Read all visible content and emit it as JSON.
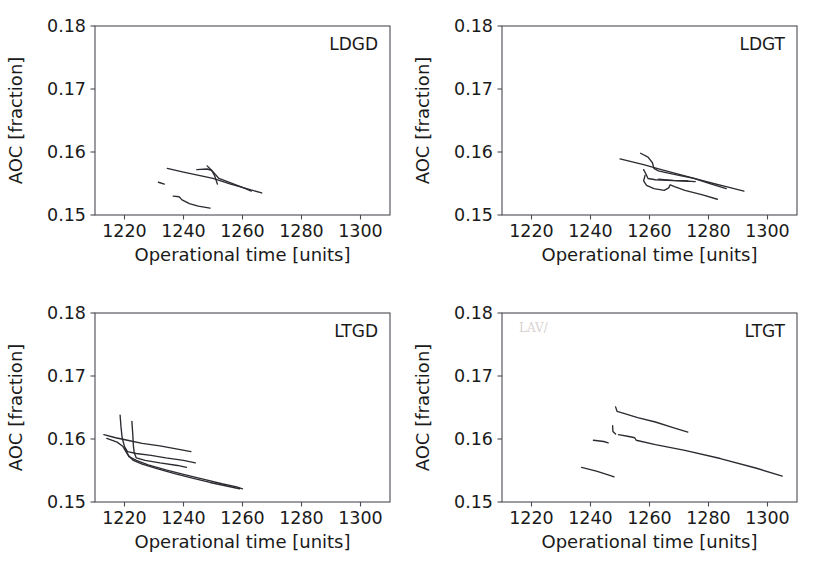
{
  "figure": {
    "background": "#ffffff",
    "line_color": "#2b2b31",
    "axis_color": "#4a4a52",
    "rows": 2,
    "cols": 2
  },
  "chart_data": [
    {
      "type": "line",
      "title": "LDGD",
      "panel_label": "LDGD",
      "xlabel": "Operational time [units]",
      "ylabel": "AOC [fraction]",
      "xlim": [
        1210,
        1310
      ],
      "ylim": [
        0.15,
        0.18
      ],
      "xticks": [
        1220,
        1240,
        1260,
        1280,
        1300
      ],
      "xtick_labels": [
        "1220",
        "1240",
        "1260",
        "1280",
        "1300"
      ],
      "yticks": [
        0.15,
        0.16,
        0.17,
        0.18
      ],
      "ytick_labels": [
        "0.15",
        "0.16",
        "0.17",
        "0.18"
      ],
      "grid": false,
      "legend": "none",
      "series": [
        {
          "name": "run-1",
          "points": [
            [
              1234.5,
              0.1574
            ],
            [
              1240.0,
              0.1568
            ],
            [
              1246.0,
              0.1562
            ],
            [
              1250.0,
              0.1558
            ],
            [
              1256.0,
              0.1549
            ],
            [
              1262.0,
              0.1541
            ],
            [
              1266.5,
              0.1535
            ]
          ]
        },
        {
          "name": "run-2",
          "points": [
            [
              1244.5,
              0.1572
            ],
            [
              1248.0,
              0.1573
            ],
            [
              1249.5,
              0.1571
            ],
            [
              1250.5,
              0.1566
            ],
            [
              1252.0,
              0.1558
            ],
            [
              1256.0,
              0.1551
            ],
            [
              1260.0,
              0.1544
            ],
            [
              1263.0,
              0.1538
            ]
          ]
        },
        {
          "name": "run-3",
          "points": [
            [
              1248.0,
              0.1578
            ],
            [
              1249.5,
              0.1571
            ],
            [
              1250.5,
              0.1563
            ],
            [
              1251.0,
              0.1556
            ],
            [
              1251.5,
              0.1549
            ]
          ]
        },
        {
          "name": "run-4",
          "points": [
            [
              1231.5,
              0.1552
            ],
            [
              1233.5,
              0.1549
            ]
          ]
        },
        {
          "name": "run-5",
          "points": [
            [
              1236.5,
              0.153
            ],
            [
              1238.5,
              0.1529
            ],
            [
              1239.5,
              0.1524
            ],
            [
              1242.0,
              0.1518
            ],
            [
              1245.0,
              0.1514
            ],
            [
              1249.0,
              0.1511
            ]
          ]
        }
      ]
    },
    {
      "type": "line",
      "title": "LDGT",
      "panel_label": "LDGT",
      "xlabel": "Operational time [units]",
      "ylabel": "AOC [fraction]",
      "xlim": [
        1210,
        1310
      ],
      "ylim": [
        0.15,
        0.18
      ],
      "xticks": [
        1220,
        1240,
        1260,
        1280,
        1300
      ],
      "xtick_labels": [
        "1220",
        "1240",
        "1260",
        "1280",
        "1300"
      ],
      "yticks": [
        0.15,
        0.16,
        0.17,
        0.18
      ],
      "ytick_labels": [
        "0.15",
        "0.16",
        "0.17",
        "0.18"
      ],
      "grid": false,
      "legend": "none",
      "series": [
        {
          "name": "run-1",
          "points": [
            [
              1250.0,
              0.1589
            ],
            [
              1258.0,
              0.158
            ],
            [
              1264.0,
              0.1572
            ],
            [
              1272.0,
              0.1562
            ],
            [
              1280.0,
              0.1552
            ],
            [
              1286.0,
              0.1545
            ],
            [
              1292.0,
              0.1538
            ]
          ]
        },
        {
          "name": "run-2",
          "points": [
            [
              1257.0,
              0.1598
            ],
            [
              1259.5,
              0.1592
            ],
            [
              1261.0,
              0.1583
            ],
            [
              1261.5,
              0.1574
            ],
            [
              1263.0,
              0.157
            ],
            [
              1266.0,
              0.1567
            ],
            [
              1270.0,
              0.1563
            ],
            [
              1275.0,
              0.1558
            ],
            [
              1281.0,
              0.1549
            ],
            [
              1286.0,
              0.1542
            ]
          ]
        },
        {
          "name": "run-3",
          "points": [
            [
              1258.0,
              0.1572
            ],
            [
              1258.8,
              0.1565
            ],
            [
              1259.5,
              0.1558
            ],
            [
              1262.0,
              0.1556
            ],
            [
              1266.0,
              0.1555
            ],
            [
              1272.0,
              0.1554
            ],
            [
              1275.5,
              0.1553
            ]
          ]
        },
        {
          "name": "run-4",
          "points": [
            [
              1258.5,
              0.1563
            ],
            [
              1258.0,
              0.1554
            ],
            [
              1259.0,
              0.1547
            ],
            [
              1261.5,
              0.1542
            ],
            [
              1265.0,
              0.1539
            ],
            [
              1266.5,
              0.1543
            ],
            [
              1267.0,
              0.1548
            ],
            [
              1268.5,
              0.1545
            ],
            [
              1272.0,
              0.1539
            ],
            [
              1278.0,
              0.1532
            ],
            [
              1283.0,
              0.1525
            ]
          ]
        },
        {
          "name": "run-5",
          "points": [
            [
              1263.0,
              0.1557
            ],
            [
              1268.0,
              0.1555
            ],
            [
              1273.0,
              0.1554
            ]
          ]
        }
      ]
    },
    {
      "type": "line",
      "title": "LTGD",
      "panel_label": "LTGD",
      "xlabel": "Operational time [units]",
      "ylabel": "AOC [fraction]",
      "xlim": [
        1210,
        1310
      ],
      "ylim": [
        0.15,
        0.18
      ],
      "xticks": [
        1220,
        1240,
        1260,
        1280,
        1300
      ],
      "xtick_labels": [
        "1220",
        "1240",
        "1260",
        "1280",
        "1300"
      ],
      "yticks": [
        0.15,
        0.16,
        0.17,
        0.18
      ],
      "ytick_labels": [
        "0.15",
        "0.16",
        "0.17",
        "0.18"
      ],
      "grid": false,
      "legend": "none",
      "series": [
        {
          "name": "run-1",
          "points": [
            [
              1213.0,
              0.1607
            ],
            [
              1217.0,
              0.1602
            ],
            [
              1221.0,
              0.1598
            ],
            [
              1226.0,
              0.1593
            ],
            [
              1232.0,
              0.1589
            ],
            [
              1238.0,
              0.1584
            ],
            [
              1242.5,
              0.158
            ]
          ]
        },
        {
          "name": "run-2",
          "points": [
            [
              1218.5,
              0.1638
            ],
            [
              1218.8,
              0.162
            ],
            [
              1219.2,
              0.1602
            ],
            [
              1220.0,
              0.1588
            ],
            [
              1221.0,
              0.158
            ],
            [
              1224.0,
              0.1577
            ],
            [
              1229.0,
              0.1574
            ],
            [
              1234.0,
              0.157
            ],
            [
              1240.0,
              0.1566
            ],
            [
              1244.0,
              0.1562
            ]
          ]
        },
        {
          "name": "run-3",
          "points": [
            [
              1222.5,
              0.1628
            ],
            [
              1222.8,
              0.1608
            ],
            [
              1223.0,
              0.159
            ],
            [
              1223.3,
              0.1578
            ],
            [
              1224.0,
              0.157
            ],
            [
              1227.0,
              0.1566
            ],
            [
              1232.0,
              0.1562
            ],
            [
              1238.0,
              0.1558
            ],
            [
              1241.0,
              0.1555
            ]
          ]
        },
        {
          "name": "run-4",
          "points": [
            [
              1214.0,
              0.1601
            ],
            [
              1217.5,
              0.1595
            ],
            [
              1219.5,
              0.1588
            ],
            [
              1220.5,
              0.158
            ],
            [
              1221.5,
              0.1572
            ],
            [
              1224.0,
              0.1566
            ],
            [
              1228.0,
              0.1559
            ],
            [
              1234.0,
              0.1551
            ],
            [
              1240.0,
              0.1544
            ],
            [
              1247.0,
              0.1536
            ],
            [
              1253.0,
              0.1529
            ],
            [
              1258.0,
              0.1524
            ],
            [
              1260.0,
              0.1521
            ]
          ]
        },
        {
          "name": "run-5",
          "points": [
            [
              1220.0,
              0.1585
            ],
            [
              1221.5,
              0.1573
            ],
            [
              1223.0,
              0.1566
            ],
            [
              1226.0,
              0.156
            ],
            [
              1231.0,
              0.1553
            ],
            [
              1237.0,
              0.1545
            ],
            [
              1243.0,
              0.1538
            ],
            [
              1249.0,
              0.1531
            ],
            [
              1255.0,
              0.1525
            ],
            [
              1259.0,
              0.1521
            ]
          ]
        }
      ]
    },
    {
      "type": "line",
      "title": "LTGT",
      "panel_label": "LTGT",
      "xlabel": "Operational time [units]",
      "ylabel": "AOC [fraction]",
      "xlim": [
        1210,
        1310
      ],
      "ylim": [
        0.15,
        0.18
      ],
      "xticks": [
        1220,
        1240,
        1260,
        1280,
        1300
      ],
      "xtick_labels": [
        "1220",
        "1240",
        "1260",
        "1280",
        "1300"
      ],
      "yticks": [
        0.15,
        0.16,
        0.17,
        0.18
      ],
      "ytick_labels": [
        "0.15",
        "0.16",
        "0.17",
        "0.18"
      ],
      "grid": false,
      "legend": "none",
      "series": [
        {
          "name": "run-1",
          "points": [
            [
              1248.5,
              0.1651
            ],
            [
              1249.0,
              0.1644
            ],
            [
              1251.0,
              0.1641
            ],
            [
              1256.0,
              0.1634
            ],
            [
              1262.0,
              0.1627
            ],
            [
              1268.0,
              0.1618
            ],
            [
              1273.0,
              0.1611
            ]
          ]
        },
        {
          "name": "run-2",
          "points": [
            [
              1247.5,
              0.1621
            ],
            [
              1247.6,
              0.1612
            ],
            [
              1248.5,
              0.1608
            ]
          ]
        },
        {
          "name": "run-3",
          "points": [
            [
              1249.5,
              0.1607
            ],
            [
              1253.0,
              0.1604
            ],
            [
              1255.0,
              0.1602
            ],
            [
              1255.5,
              0.1598
            ],
            [
              1262.0,
              0.1591
            ],
            [
              1272.0,
              0.1582
            ],
            [
              1284.0,
              0.1569
            ],
            [
              1296.0,
              0.1554
            ],
            [
              1305.0,
              0.1541
            ]
          ]
        },
        {
          "name": "run-4",
          "points": [
            [
              1241.0,
              0.1598
            ],
            [
              1244.5,
              0.1596
            ],
            [
              1246.0,
              0.1594
            ]
          ]
        },
        {
          "name": "run-5",
          "points": [
            [
              1237.0,
              0.1555
            ],
            [
              1242.0,
              0.1549
            ],
            [
              1246.0,
              0.1543
            ],
            [
              1248.0,
              0.154
            ]
          ]
        }
      ]
    }
  ]
}
